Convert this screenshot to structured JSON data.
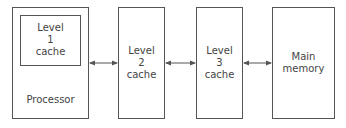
{
  "diagram": {
    "type": "memory-hierarchy",
    "nodes": [
      {
        "id": "processor",
        "label": "Processor"
      },
      {
        "id": "l1",
        "label": "Level\n1\ncache",
        "parent": "processor"
      },
      {
        "id": "l2",
        "label": "Level\n2\ncache"
      },
      {
        "id": "l3",
        "label": "Level\n3\ncache"
      },
      {
        "id": "mem",
        "label": "Main\nmemory"
      }
    ],
    "edges": [
      {
        "from": "processor",
        "to": "l2",
        "style": "bidirectional-arrow"
      },
      {
        "from": "l2",
        "to": "l3",
        "style": "bidirectional-arrow"
      },
      {
        "from": "l3",
        "to": "mem",
        "style": "bidirectional-arrow"
      }
    ]
  }
}
